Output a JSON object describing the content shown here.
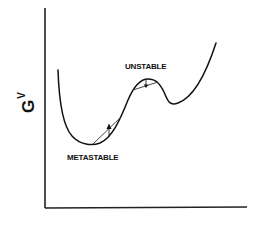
{
  "diagram": {
    "type": "free-energy-curve",
    "y_axis_label": {
      "symbol": "G",
      "superscript": "V"
    },
    "x_axis_label": "",
    "regions": [
      {
        "id": "unstable",
        "label": "UNSTABLE"
      },
      {
        "id": "metastable",
        "label": "METASTABLE"
      }
    ],
    "colors": {
      "ink": "#111111",
      "background": "#ffffff"
    }
  }
}
